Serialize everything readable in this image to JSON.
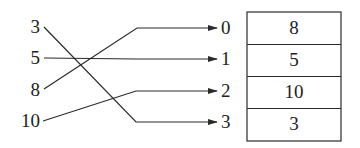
{
  "diagram": {
    "type": "mapping",
    "source_values": [
      "3",
      "5",
      "8",
      "10"
    ],
    "indices": [
      "0",
      "1",
      "2",
      "3"
    ],
    "array_cells": [
      "8",
      "5",
      "10",
      "3"
    ],
    "mappings": [
      {
        "from": "3",
        "to_index": "3"
      },
      {
        "from": "5",
        "to_index": "1"
      },
      {
        "from": "8",
        "to_index": "0"
      },
      {
        "from": "10",
        "to_index": "2"
      }
    ],
    "line_color": "#2a2a2a"
  }
}
